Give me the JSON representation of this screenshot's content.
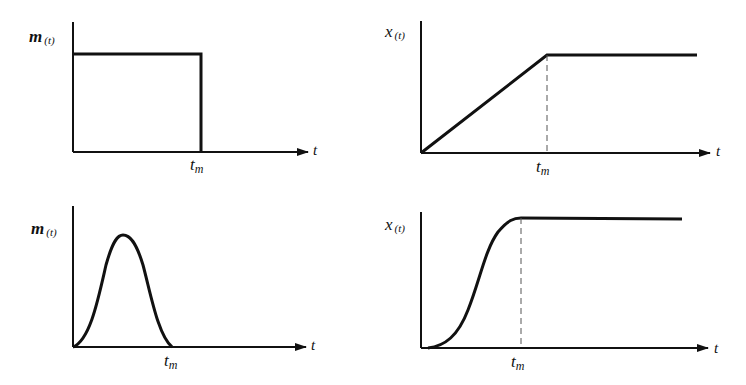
{
  "panels": [
    {
      "id": "top-left",
      "y_label": "m",
      "y_label_sub": "(t)",
      "x_label": "t",
      "marker_label": "t",
      "marker_sub": "m",
      "shape": "rectangular pulse"
    },
    {
      "id": "top-right",
      "y_label": "x",
      "y_label_sub": "(t)",
      "x_label": "t",
      "marker_label": "t",
      "marker_sub": "m",
      "shape": "ramp then constant"
    },
    {
      "id": "bottom-left",
      "y_label": "m",
      "y_label_sub": "(t)",
      "x_label": "t",
      "marker_label": "t",
      "marker_sub": "m",
      "shape": "bell-shaped pulse"
    },
    {
      "id": "bottom-right",
      "y_label": "x",
      "y_label_sub": "(t)",
      "x_label": "t",
      "marker_label": "t",
      "marker_sub": "m",
      "shape": "S-curve then constant"
    }
  ],
  "colors": {
    "ink": "#111111",
    "background": "#ffffff"
  }
}
